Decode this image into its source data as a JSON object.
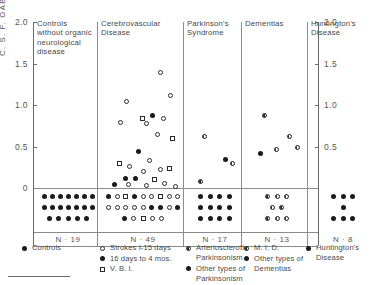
{
  "chart_data": {
    "type": "scatter",
    "title": "",
    "ylabel": "C. S. F.  GABA  μmol/L",
    "xlabel": "",
    "ylim": [
      0,
      2.0
    ],
    "yticks": [
      0,
      0.5,
      1.0,
      1.5,
      2.0
    ],
    "ytick_labels": [
      "0",
      "0.5",
      "1.0",
      "1.5",
      "2.0"
    ],
    "grid": false,
    "legend_position": "bottom",
    "note": "Below-axis rows represent undetectable / zero values plotted as stacked dot arrays",
    "groups": [
      {
        "name": "Controls without organic neurological disease",
        "n_label": "N · 19",
        "n": 19,
        "detectable_points": [],
        "undetectable_rows": [
          {
            "marker": "filled",
            "count": 7
          },
          {
            "marker": "filled",
            "count": 7
          },
          {
            "marker": "filled",
            "count": 5
          }
        ]
      },
      {
        "name": "Cerebrovascular Disease",
        "n_label": "N · 49",
        "n": 49,
        "detectable_points": [
          {
            "marker": "open",
            "value": 1.04
          },
          {
            "marker": "open",
            "value": 1.39
          },
          {
            "marker": "open",
            "value": 1.12
          },
          {
            "marker": "open",
            "value": 0.79
          },
          {
            "marker": "square",
            "value": 0.84
          },
          {
            "marker": "filled",
            "value": 0.87
          },
          {
            "marker": "open",
            "value": 0.84
          },
          {
            "marker": "open",
            "value": 0.78
          },
          {
            "marker": "open",
            "value": 0.64
          },
          {
            "marker": "square",
            "value": 0.6
          },
          {
            "marker": "filled",
            "value": 0.44
          },
          {
            "marker": "square",
            "value": 0.29
          },
          {
            "marker": "open",
            "value": 0.26
          },
          {
            "marker": "open",
            "value": 0.33
          },
          {
            "marker": "square",
            "value": 0.23
          },
          {
            "marker": "open",
            "value": 0.22
          },
          {
            "marker": "open",
            "value": 0.2
          },
          {
            "marker": "filled",
            "value": 0.12
          },
          {
            "marker": "filled",
            "value": 0.11
          },
          {
            "marker": "square",
            "value": 0.1
          },
          {
            "marker": "filled",
            "value": 0.04
          },
          {
            "marker": "open",
            "value": 0.04
          },
          {
            "marker": "open",
            "value": 0.03
          },
          {
            "marker": "open",
            "value": 0.06
          },
          {
            "marker": "open",
            "value": 0.02
          }
        ],
        "undetectable_rows": [
          {
            "markers": [
              "filled",
              "open",
              "square",
              "filled",
              "open",
              "open",
              "square",
              "open",
              "open"
            ]
          },
          {
            "markers": [
              "open",
              "open",
              "open",
              "open",
              "open",
              "filled",
              "filled",
              "open",
              "filled"
            ]
          },
          {
            "markers": [
              "filled",
              "open",
              "square",
              "open",
              "open"
            ]
          }
        ]
      },
      {
        "name": "Parkinson's Syndrome",
        "n_label": "N · 17",
        "n": 17,
        "detectable_points": [
          {
            "marker": "half",
            "value": 0.62
          },
          {
            "marker": "filled",
            "value": 0.34
          },
          {
            "marker": "half",
            "value": 0.29
          },
          {
            "marker": "half",
            "value": 0.08
          }
        ],
        "undetectable_rows": [
          {
            "marker": "filled",
            "count": 4
          },
          {
            "marker": "filled",
            "count": 4
          },
          {
            "marker": "filled",
            "count": 4
          }
        ]
      },
      {
        "name": "Dementias",
        "n_label": "N · 13",
        "n": 13,
        "detectable_points": [
          {
            "marker": "half",
            "value": 0.87
          },
          {
            "marker": "half",
            "value": 0.62
          },
          {
            "marker": "half",
            "value": 0.49
          },
          {
            "marker": "filled",
            "value": 0.42
          },
          {
            "marker": "half",
            "value": 0.46
          }
        ],
        "undetectable_rows": [
          {
            "marker": "half",
            "count": 3
          },
          {
            "marker": "half",
            "count": 2
          },
          {
            "marker": "half",
            "count": 3
          }
        ]
      },
      {
        "name": "Huntington's Disease",
        "n_label": "N · 8",
        "n": 8,
        "detectable_points": [],
        "undetectable_rows": [
          {
            "marker": "filled",
            "count": 3
          },
          {
            "marker": "filled",
            "count": 1
          },
          {
            "marker": "filled",
            "count": 3
          }
        ]
      }
    ],
    "legend": [
      {
        "items": [
          {
            "marker": "filled",
            "label": "Controls"
          }
        ]
      },
      {
        "items": [
          {
            "marker": "open",
            "label": "Strokes I-15 days"
          },
          {
            "marker": "filled",
            "label": "16 days to 4 mos."
          },
          {
            "marker": "square",
            "label": "V. B. I."
          }
        ]
      },
      {
        "items": [
          {
            "marker": "half",
            "label": "Arteriosclerotic Parkinsonism"
          },
          {
            "marker": "filled",
            "label": "Other types of Parkinsonism"
          }
        ]
      },
      {
        "items": [
          {
            "marker": "half",
            "label": "M. I. D."
          },
          {
            "marker": "filled",
            "label": "Other types of Dementias"
          }
        ]
      },
      {
        "items": [
          {
            "marker": "filled",
            "label": "Huntington's Disease"
          }
        ]
      }
    ]
  },
  "axis": {
    "ylabel": "C. S. F.  GABA  μmol/L",
    "left_ticks": [
      "2.0",
      "1.5",
      "1.0",
      "0.5",
      "0"
    ],
    "right_ticks": [
      "2.0",
      "1.5",
      "1.0",
      "0.5"
    ]
  },
  "headers": [
    {
      "lines": [
        "Controls",
        "without organic",
        "neurological",
        "disease"
      ]
    },
    {
      "lines": [
        "Cerebrovascular",
        "Disease"
      ]
    },
    {
      "lines": [
        "Parkinson's",
        "Syndrome"
      ]
    },
    {
      "lines": [
        "Dementias"
      ]
    },
    {
      "lines": [
        "Huntington's",
        "Disease"
      ]
    }
  ],
  "n_labels": [
    "N · 19",
    "N · 49",
    "N · 17",
    "N · 13",
    "N · 8"
  ]
}
